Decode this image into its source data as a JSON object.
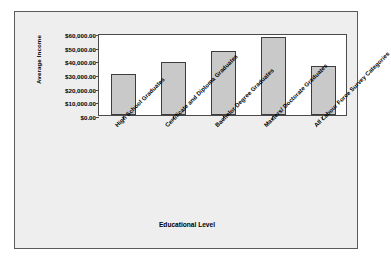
{
  "chart_data": {
    "type": "bar",
    "title": "",
    "xlabel": "Educational Level",
    "ylabel": "Average Income",
    "categories": [
      "High School Graduates",
      "Certificate and Diploma Graduates",
      "Bachelor Degree Graduates",
      "Masters/ Doctorate Graduates",
      "All Labour Force Survey Categories"
    ],
    "values": [
      30000,
      39000,
      47000,
      57000,
      35500
    ],
    "ylim": [
      0,
      60000
    ],
    "yticks": [
      0,
      10000,
      20000,
      30000,
      40000,
      50000,
      60000
    ],
    "ytick_labels": [
      "$0.00",
      "$10,000.00",
      "$20,000.00",
      "$30,000.00",
      "$40,000.00",
      "$50,000.00",
      "$60,000.00"
    ],
    "grid": false,
    "legend": false,
    "bar_fill_color": "#c9c9c9",
    "bar_border_color": "#3d3d3d",
    "plot_background": "#ffffff",
    "canvas_background": "#eeeeee",
    "frame_color": "#5a5a5a"
  }
}
